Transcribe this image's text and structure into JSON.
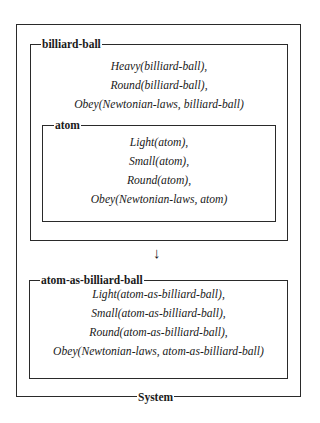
{
  "diagram": {
    "system": {
      "label": "System"
    },
    "billiard_ball": {
      "label": "billiard-ball",
      "facts": [
        "Heavy(billiard-ball),",
        "Round(billiard-ball),",
        "Obey(Newtonian-laws, billiard-ball)"
      ]
    },
    "atom": {
      "label": "atom",
      "facts": [
        "Light(atom),",
        "Small(atom),",
        "Round(atom),",
        "Obey(Newtonian-laws, atom)"
      ]
    },
    "arrow": {
      "glyph": "↓"
    },
    "atom_as_billiard_ball": {
      "label": "atom-as-billiard-ball",
      "facts": [
        "Light(atom-as-billiard-ball),",
        "Small(atom-as-billiard-ball),",
        "Round(atom-as-billiard-ball),",
        "Obey(Newtonian-laws, atom-as-billiard-ball)"
      ]
    }
  }
}
